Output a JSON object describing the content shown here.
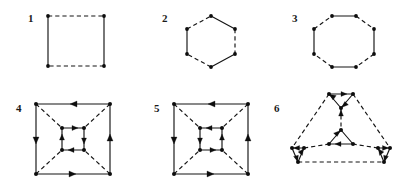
{
  "page": {
    "background_color": "#ffffff",
    "ink_color": "#141414",
    "width": 408,
    "height": 190
  },
  "figures": [
    {
      "label": "1",
      "name": "square-4-cycle",
      "shape": "square",
      "vertex_count": 4,
      "edges_solid": 2,
      "edges_dashed": 2,
      "arrow_count": 0,
      "description": "Square with solid left and right sides and dashed top and bottom sides; four corner vertices."
    },
    {
      "label": "2",
      "name": "hexagon-6-cycle",
      "shape": "hexagon",
      "vertex_count": 6,
      "edges_solid": 3,
      "edges_dashed": 3,
      "arrow_count": 0,
      "description": "Hexagon with alternating solid and dashed edges; six vertices."
    },
    {
      "label": "3",
      "name": "octagon-8-cycle",
      "shape": "octagon",
      "vertex_count": 8,
      "edges_solid": 4,
      "edges_dashed": 4,
      "arrow_count": 0,
      "description": "Octagon with alternating solid and dashed edges; eight vertices."
    },
    {
      "label": "4",
      "name": "nested-squares-graph-a",
      "shape": "nested-squares",
      "vertex_count": 8,
      "edges_solid": 8,
      "edges_dashed": 4,
      "arrow_count": 8,
      "description": "Outer square and inner square joined by four dashed diagonals; all square edges are directed."
    },
    {
      "label": "5",
      "name": "nested-squares-graph-b",
      "shape": "nested-squares",
      "vertex_count": 8,
      "edges_solid": 8,
      "edges_dashed": 4,
      "arrow_count": 8,
      "description": "Outer square and inner square joined by four dashed diagonals; variant orientation of inner directed cycle."
    },
    {
      "label": "6",
      "name": "triangle-corner-triangles-graph",
      "shape": "triangle-with-corner-and-center-triangles",
      "vertex_count": 9,
      "edges_solid": 9,
      "edges_dashed": 6,
      "arrow_count": 9,
      "description": "Large dashed triangle with small directed triangles at the three corners and one directed triangle at the centre, joined by dashed spokes."
    }
  ]
}
